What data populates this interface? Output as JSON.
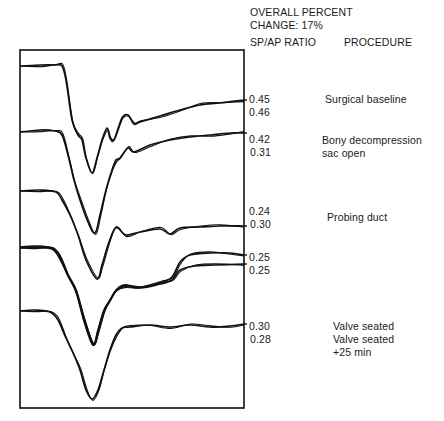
{
  "header": {
    "overall_line1": "OVERALL PERCENT",
    "overall_line2": "CHANGE: 17%",
    "ratio_col": "SP/AP RATIO",
    "procedure_col": "PROCEDURE"
  },
  "rows": [
    {
      "ratios": [
        "0.45",
        "0.46"
      ],
      "procedure": [
        "Surgical baseline"
      ]
    },
    {
      "ratios": [
        "0.42",
        "0.31"
      ],
      "procedure": [
        "Bony decompression",
        "sac open"
      ]
    },
    {
      "ratios": [
        "0.24",
        "0.30"
      ],
      "procedure": [
        "Probing duct"
      ]
    },
    {
      "ratios": [
        "0.25",
        "0.25"
      ],
      "procedure": []
    },
    {
      "ratios": [
        "0.30",
        "0.28"
      ],
      "procedure": [
        "Valve seated",
        "Valve seated",
        "+25 min"
      ]
    }
  ],
  "chart_data": {
    "type": "line",
    "title": "",
    "overall_percent_change": "17%",
    "xlabel": "",
    "ylabel": "",
    "grid": false,
    "legend": "none",
    "columns": [
      "SP/AP RATIO",
      "PROCEDURE"
    ],
    "series": [
      {
        "name": "Surgical baseline",
        "sp_ap_ratio": [
          0.45,
          0.46
        ],
        "points": [
          [
            20,
            66
          ],
          [
            40,
            65
          ],
          [
            55,
            65
          ],
          [
            62,
            66
          ],
          [
            66,
            80
          ],
          [
            72,
            120
          ],
          [
            78,
            135
          ],
          [
            82,
            140
          ],
          [
            86,
            158
          ],
          [
            92,
            173
          ],
          [
            97,
            158
          ],
          [
            102,
            140
          ],
          [
            107,
            128
          ],
          [
            110,
            138
          ],
          [
            114,
            140
          ],
          [
            122,
            118
          ],
          [
            128,
            115
          ],
          [
            134,
            124
          ],
          [
            140,
            122
          ],
          [
            160,
            116
          ],
          [
            180,
            110
          ],
          [
            200,
            105
          ],
          [
            220,
            103
          ],
          [
            244,
            100
          ]
        ]
      },
      {
        "name": "Bony decompression sac open",
        "sp_ap_ratio": [
          0.42,
          0.31
        ],
        "points": [
          [
            20,
            132
          ],
          [
            40,
            130
          ],
          [
            55,
            131
          ],
          [
            62,
            135
          ],
          [
            68,
            155
          ],
          [
            74,
            180
          ],
          [
            80,
            200
          ],
          [
            88,
            222
          ],
          [
            95,
            233
          ],
          [
            100,
            215
          ],
          [
            106,
            190
          ],
          [
            112,
            170
          ],
          [
            116,
            160
          ],
          [
            120,
            158
          ],
          [
            128,
            148
          ],
          [
            134,
            152
          ],
          [
            150,
            145
          ],
          [
            170,
            140
          ],
          [
            190,
            137
          ],
          [
            210,
            135
          ],
          [
            230,
            133
          ],
          [
            244,
            133
          ]
        ]
      },
      {
        "name": "Probing duct",
        "sp_ap_ratio": [
          0.24,
          0.3
        ],
        "points": [
          [
            20,
            191
          ],
          [
            40,
            190
          ],
          [
            56,
            192
          ],
          [
            62,
            200
          ],
          [
            70,
            215
          ],
          [
            78,
            235
          ],
          [
            86,
            260
          ],
          [
            97,
            279
          ],
          [
            102,
            265
          ],
          [
            108,
            245
          ],
          [
            114,
            230
          ],
          [
            118,
            228
          ],
          [
            126,
            235
          ],
          [
            140,
            232
          ],
          [
            160,
            229
          ],
          [
            170,
            234
          ],
          [
            180,
            228
          ],
          [
            200,
            227
          ],
          [
            220,
            226
          ],
          [
            244,
            226
          ]
        ]
      },
      {
        "name": "Procedure 4 (trace a)",
        "sp_ap_ratio": [
          0.25
        ],
        "points": [
          [
            20,
            247
          ],
          [
            35,
            246
          ],
          [
            52,
            248
          ],
          [
            60,
            258
          ],
          [
            68,
            275
          ],
          [
            76,
            290
          ],
          [
            84,
            320
          ],
          [
            93,
            345
          ],
          [
            98,
            330
          ],
          [
            104,
            310
          ],
          [
            110,
            300
          ],
          [
            116,
            290
          ],
          [
            124,
            285
          ],
          [
            140,
            287
          ],
          [
            160,
            283
          ],
          [
            172,
            277
          ],
          [
            180,
            262
          ],
          [
            190,
            255
          ],
          [
            210,
            253
          ],
          [
            230,
            253
          ],
          [
            244,
            255
          ]
        ]
      },
      {
        "name": "Procedure 4 (trace b)",
        "sp_ap_ratio": [
          0.25
        ],
        "points": [
          [
            20,
            248
          ],
          [
            35,
            247
          ],
          [
            52,
            249
          ],
          [
            60,
            259
          ],
          [
            68,
            276
          ],
          [
            76,
            292
          ],
          [
            84,
            321
          ],
          [
            93,
            345
          ],
          [
            98,
            331
          ],
          [
            104,
            311
          ],
          [
            110,
            301
          ],
          [
            116,
            291
          ],
          [
            124,
            286
          ],
          [
            140,
            288
          ],
          [
            160,
            284
          ],
          [
            172,
            280
          ],
          [
            180,
            270
          ],
          [
            195,
            266
          ],
          [
            215,
            265
          ],
          [
            244,
            264
          ]
        ]
      },
      {
        "name": "Valve seated / +25 min",
        "sp_ap_ratio": [
          0.3,
          0.28
        ],
        "points": [
          [
            20,
            311
          ],
          [
            35,
            310
          ],
          [
            50,
            312
          ],
          [
            58,
            320
          ],
          [
            66,
            338
          ],
          [
            74,
            355
          ],
          [
            80,
            370
          ],
          [
            86,
            390
          ],
          [
            92,
            399
          ],
          [
            98,
            390
          ],
          [
            104,
            370
          ],
          [
            110,
            350
          ],
          [
            116,
            335
          ],
          [
            122,
            328
          ],
          [
            130,
            327
          ],
          [
            150,
            325
          ],
          [
            170,
            327
          ],
          [
            190,
            325
          ],
          [
            210,
            327
          ],
          [
            230,
            326
          ],
          [
            244,
            324
          ]
        ]
      }
    ],
    "frame": {
      "x": 20,
      "y": 50,
      "width": 224,
      "height": 358
    }
  }
}
